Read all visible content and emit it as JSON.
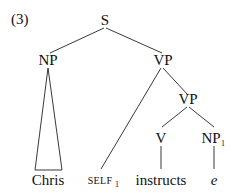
{
  "example_number": "(3)",
  "tree": {
    "root": "S",
    "subject_np": "NP",
    "subject_leaf": "Chris",
    "vp_upper": "VP",
    "self_leaf": "SELF",
    "self_index": "1",
    "vp_lower": "VP",
    "verb": "V",
    "verb_leaf": "instructs",
    "object_np": "NP",
    "object_index": "1",
    "object_leaf": "e"
  }
}
